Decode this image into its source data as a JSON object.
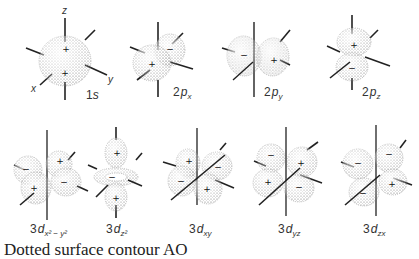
{
  "figure": {
    "orbitals": [
      {
        "id": "1s",
        "prefix": "1",
        "letter": "s",
        "sub": "",
        "lobes": [
          {
            "sign": "+"
          },
          {
            "sign": "+"
          }
        ]
      },
      {
        "id": "2px",
        "prefix": "2",
        "letter": "p",
        "sub": "x",
        "lobes": [
          {
            "sign": "+"
          },
          {
            "sign": "-"
          }
        ]
      },
      {
        "id": "2py",
        "prefix": "2",
        "letter": "p",
        "sub": "y",
        "lobes": [
          {
            "sign": "-"
          },
          {
            "sign": "+"
          }
        ]
      },
      {
        "id": "2pz",
        "prefix": "2",
        "letter": "p",
        "sub": "z",
        "lobes": [
          {
            "sign": "+"
          },
          {
            "sign": "-"
          }
        ]
      },
      {
        "id": "3dx2-y2",
        "prefix": "3",
        "letter": "d",
        "sub": "x² − y²",
        "lobes": [
          {
            "sign": "-"
          },
          {
            "sign": "+"
          },
          {
            "sign": "+"
          },
          {
            "sign": "-"
          }
        ]
      },
      {
        "id": "3dz2",
        "prefix": "3",
        "letter": "d",
        "sub": "z²",
        "lobes": [
          {
            "sign": "+"
          },
          {
            "sign": "-"
          },
          {
            "sign": "+"
          }
        ]
      },
      {
        "id": "3dxy",
        "prefix": "3",
        "letter": "d",
        "sub": "xy",
        "lobes": [
          {
            "sign": "+"
          },
          {
            "sign": "-"
          },
          {
            "sign": "-"
          },
          {
            "sign": "+"
          }
        ]
      },
      {
        "id": "3dyz",
        "prefix": "3",
        "letter": "d",
        "sub": "yz",
        "lobes": [
          {
            "sign": "-"
          },
          {
            "sign": "+"
          },
          {
            "sign": "+"
          },
          {
            "sign": "-"
          }
        ]
      },
      {
        "id": "3dzx",
        "prefix": "3",
        "letter": "d",
        "sub": "zx",
        "lobes": [
          {
            "sign": "-"
          },
          {
            "sign": "-"
          },
          {
            "sign": "+"
          },
          {
            "sign": "-"
          }
        ]
      }
    ],
    "axes": {
      "x": "x",
      "y": "y",
      "z": "z"
    },
    "caption": "Dotted surface contour AO"
  }
}
